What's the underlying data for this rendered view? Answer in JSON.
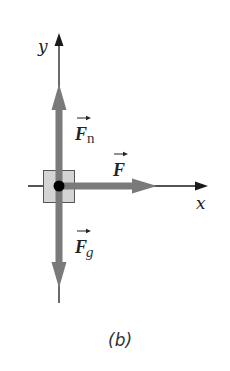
{
  "diagram": {
    "type": "free-body-diagram",
    "axes": {
      "x_label": "x",
      "y_label": "y"
    },
    "forces": [
      {
        "name": "normal-force",
        "symbol": "F",
        "subscript": "n",
        "direction": "up"
      },
      {
        "name": "applied-force",
        "symbol": "F",
        "subscript": "",
        "direction": "right"
      },
      {
        "name": "gravitational-force",
        "symbol": "F",
        "subscript": "g",
        "direction": "down"
      }
    ],
    "object": "block",
    "caption": "(b)",
    "colors": {
      "axis": "#1a1a1a",
      "force_vector": "#7a7a7a",
      "block_fill": "#d4d4d4",
      "block_stroke": "#555555",
      "point": "#000000"
    }
  }
}
